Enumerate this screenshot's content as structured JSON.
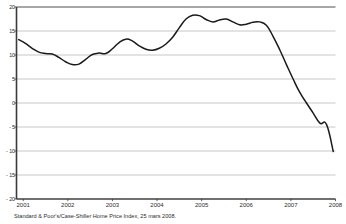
{
  "chart_data": {
    "type": "line",
    "title": "",
    "subtitle": "",
    "xlabel": "",
    "ylabel": "",
    "source_note": "Standard & Poor's/Case-Shiller Home Price Index, 25 mars 2008.",
    "grid": true,
    "legend": false,
    "legend_position": "none",
    "line_color": "#1a1a1a",
    "grid_color": "#b0b0b0",
    "axis_color": "#3a3a3a",
    "background_color": "#ffffff",
    "xlim": [
      2000.85,
      2008.0
    ],
    "ylim": [
      -20,
      20
    ],
    "xticks": [
      2001,
      2002,
      2003,
      2004,
      2005,
      2006,
      2007,
      2008
    ],
    "xtick_labels": [
      "2001",
      "2002",
      "2003",
      "2004",
      "2005",
      "2006",
      "2007",
      "2008"
    ],
    "yticks": [
      20,
      15,
      10,
      5,
      0,
      -5,
      -10,
      -15,
      -20
    ],
    "ytick_labels": [
      "20",
      "15",
      "10",
      "5",
      "0",
      "- 5",
      "- 10",
      "- 15",
      "- 20"
    ],
    "series": [
      {
        "name": "Case-Shiller Home Price Index annual change (%)",
        "x": [
          2000.9,
          2001.05,
          2001.2,
          2001.35,
          2001.5,
          2001.65,
          2001.8,
          2001.95,
          2002.1,
          2002.25,
          2002.4,
          2002.55,
          2002.7,
          2002.85,
          2003.0,
          2003.15,
          2003.3,
          2003.45,
          2003.6,
          2003.75,
          2003.9,
          2004.05,
          2004.2,
          2004.35,
          2004.5,
          2004.65,
          2004.8,
          2004.95,
          2005.1,
          2005.25,
          2005.4,
          2005.55,
          2005.7,
          2005.85,
          2006.0,
          2006.15,
          2006.3,
          2006.45,
          2006.6,
          2006.75,
          2006.9,
          2007.05,
          2007.2,
          2007.35,
          2007.5,
          2007.65,
          2007.8
        ],
        "y": [
          13.2,
          12.4,
          11.4,
          10.6,
          10.3,
          10.2,
          9.5,
          8.6,
          8.0,
          8.1,
          9.1,
          10.1,
          10.4,
          10.3,
          11.3,
          12.6,
          13.3,
          12.9,
          11.9,
          11.2,
          11.0,
          11.4,
          12.3,
          13.7,
          15.7,
          17.5,
          18.3,
          18.2,
          17.4,
          16.9,
          17.3,
          17.5,
          16.9,
          16.3,
          16.4,
          16.8,
          16.9,
          16.2,
          13.9,
          11.1,
          8.0,
          5.0,
          2.2,
          0.0,
          -2.1,
          -4.2,
          -4.5
        ],
        "y_end": -10.1,
        "x_end": 2007.95
      }
    ],
    "annotations": []
  },
  "axis": {
    "ytick_rows": [
      {
        "label": "20",
        "value": 20
      },
      {
        "label": "15",
        "value": 15
      },
      {
        "label": "10",
        "value": 10
      },
      {
        "label": "5",
        "value": 5
      },
      {
        "label": "0",
        "value": 0
      },
      {
        "label": "- 5",
        "value": -5
      },
      {
        "label": "- 10",
        "value": -10
      },
      {
        "label": "- 15",
        "value": -15
      },
      {
        "label": "- 20",
        "value": -20
      }
    ],
    "xtick_cols": [
      {
        "label": "2001",
        "value": 2001
      },
      {
        "label": "2002",
        "value": 2002
      },
      {
        "label": "2003",
        "value": 2003
      },
      {
        "label": "2004",
        "value": 2004
      },
      {
        "label": "2005",
        "value": 2005
      },
      {
        "label": "2006",
        "value": 2006
      },
      {
        "label": "2007",
        "value": 2007
      },
      {
        "label": "2008",
        "value": 2008
      }
    ]
  },
  "footer": {
    "source": "Standard & Poor's/Case-Shiller Home Price Index, 25 mars 2008."
  }
}
